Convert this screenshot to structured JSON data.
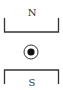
{
  "diagram": {
    "north_pole": {
      "label": "N",
      "position": "top"
    },
    "south_pole": {
      "label": "S",
      "position": "bottom"
    },
    "wire": {
      "symbol": "dot-in-circle",
      "meaning": "current out of page"
    },
    "colors": {
      "line": "#333333",
      "background": "#ffffff"
    }
  }
}
